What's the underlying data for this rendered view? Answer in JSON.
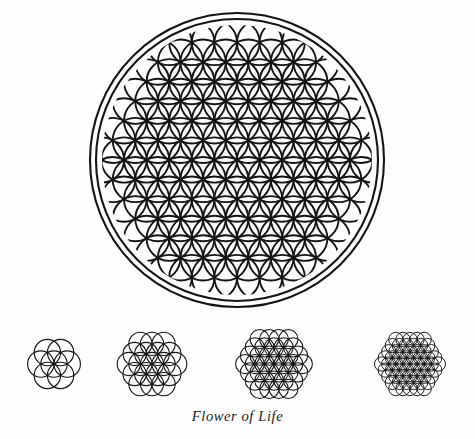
{
  "page": {
    "title": "Flower of Life",
    "background_color": "#fefefe",
    "ink_color": "#141414",
    "width": 475,
    "height": 439
  },
  "caption": {
    "text": "Flower of Life",
    "style": "italic-serif"
  },
  "main_figure": {
    "name": "flower-of-life-mandala",
    "center": {
      "x": 237,
      "y": 160
    },
    "outer_rings": [
      {
        "radius": 147,
        "stroke_width": 2.1
      },
      {
        "radius": 141,
        "stroke_width": 2.1
      }
    ],
    "pattern": {
      "circle_radius": 22.6,
      "rings": 6,
      "clip_radius": 135,
      "stroke_width": 1.9,
      "orientation_deg": 0
    }
  },
  "small_figures": [
    {
      "name": "seed-of-life",
      "label_order": 1,
      "center": {
        "x": 50,
        "y": 46
      },
      "circle_radius": 13.2,
      "rings": 1,
      "circle_count": 7,
      "stroke_width": 1.15,
      "clip": false
    },
    {
      "name": "flower-of-life-19-circle",
      "label_order": 2,
      "center": {
        "x": 50,
        "y": 46
      },
      "circle_radius": 11.6,
      "rings": 2,
      "circle_count": 19,
      "stroke_width": 1.1,
      "clip": false
    },
    {
      "name": "flower-of-life-37-circle",
      "label_order": 3,
      "center": {
        "x": 52,
        "y": 46
      },
      "circle_radius": 9.6,
      "rings": 3,
      "circle_count": 37,
      "stroke_width": 1.05,
      "clip": false
    },
    {
      "name": "flower-of-life-61-circle",
      "label_order": 4,
      "center": {
        "x": 52,
        "y": 46
      },
      "circle_radius": 7.1,
      "rings": 4,
      "circle_count": 61,
      "stroke_width": 0.95,
      "clip": false
    }
  ],
  "chart_data": {
    "type": "diagram",
    "title": "Flower of Life",
    "figures": [
      {
        "index": 0,
        "name": "Flower of Life mandala",
        "circles_in_pattern": "6-ring hexagonal grid clipped to circle",
        "enclosing_rings": 2
      },
      {
        "index": 1,
        "name": "Seed of Life",
        "circle_count": 7,
        "rings": 1
      },
      {
        "index": 2,
        "name": "19-circle Flower of Life",
        "circle_count": 19,
        "rings": 2
      },
      {
        "index": 3,
        "name": "37-circle Flower of Life",
        "circle_count": 37,
        "rings": 3
      },
      {
        "index": 4,
        "name": "61-circle Flower of Life",
        "circle_count": 61,
        "rings": 4
      }
    ]
  }
}
